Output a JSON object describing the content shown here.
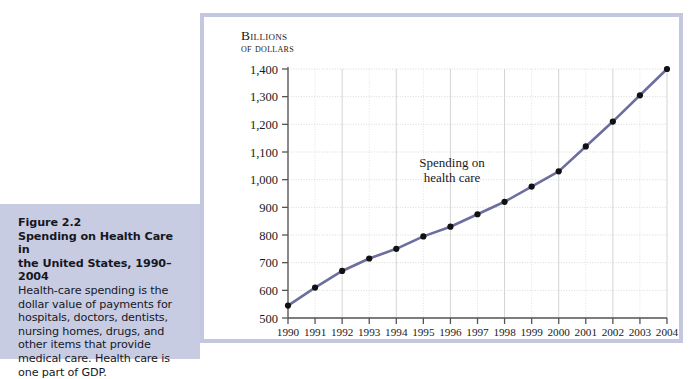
{
  "figure": {
    "label": "Figure 2.2",
    "title_line1": "Spending on Health Care in",
    "title_line2": "the United States, 1990–2004",
    "body": "Health-care spending is the dollar value of payments for hospitals, doctors, dentists, nursing homes, drugs, and other items that provide medical care. Health care is one part of GDP.",
    "box_color": "#c8cce3",
    "panel_border_color": "#c3c8e0"
  },
  "chart_data": {
    "type": "line",
    "title": "",
    "subtitle": "",
    "xlabel": "",
    "ylabel": "Billions of dollars",
    "ylabel_line1": "Billions",
    "ylabel_line2": "of dollars",
    "series_annotation": "Spending on health care",
    "series_annotation_line1": "Spending on",
    "series_annotation_line2": "health care",
    "categories": [
      "1990",
      "1991",
      "1992",
      "1993",
      "1994",
      "1995",
      "1996",
      "1997",
      "1998",
      "1999",
      "2000",
      "2001",
      "2002",
      "2003",
      "2004"
    ],
    "x": [
      1990,
      1991,
      1992,
      1993,
      1994,
      1995,
      1996,
      1997,
      1998,
      1999,
      2000,
      2001,
      2002,
      2003,
      2004
    ],
    "values": [
      545,
      610,
      670,
      715,
      750,
      795,
      830,
      875,
      920,
      975,
      1030,
      1120,
      1210,
      1305,
      1400
    ],
    "series": [
      {
        "name": "Spending on health care",
        "values": [
          545,
          610,
          670,
          715,
          750,
          795,
          830,
          875,
          920,
          975,
          1030,
          1120,
          1210,
          1305,
          1400
        ],
        "line_color": "#6b6e9e",
        "marker_color": "#111111"
      }
    ],
    "ylim": [
      500,
      1400
    ],
    "ytick_step": 100,
    "ytick_labels": [
      "500",
      "600",
      "700",
      "800",
      "900",
      "1,000",
      "1,100",
      "1,200",
      "1,300",
      "1,400"
    ],
    "ytick_values": [
      500,
      600,
      700,
      800,
      900,
      1000,
      1100,
      1200,
      1300,
      1400
    ],
    "xtick_labels": [
      "1990",
      "1991",
      "1992",
      "1993",
      "1994",
      "1995",
      "1996",
      "1997",
      "1998",
      "1999",
      "2000",
      "2001",
      "2002",
      "2003",
      "2004"
    ],
    "grid": true,
    "grid_color": "#d8d8d8",
    "legend": "none",
    "legend_position": "none",
    "axis_color": "#555555"
  }
}
